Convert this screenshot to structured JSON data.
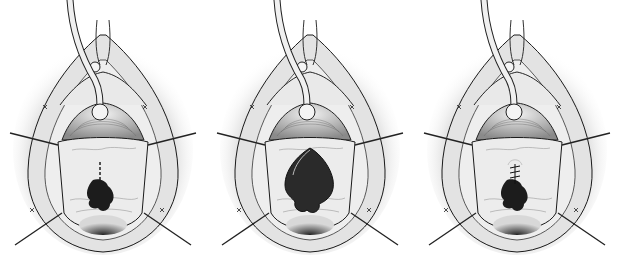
{
  "figure": {
    "panels": [
      {
        "id": "panel-1",
        "left": 0,
        "stage": "incision-marked",
        "defect": "small",
        "incision_line": true,
        "sutures": false
      },
      {
        "id": "panel-2",
        "left": 207,
        "stage": "defect-opened",
        "defect": "large",
        "incision_line": false,
        "sutures": false
      },
      {
        "id": "panel-3",
        "left": 414,
        "stage": "sutured-closure",
        "defect": "small",
        "incision_line": false,
        "sutures": true
      }
    ],
    "colors": {
      "background": "#ffffff",
      "outline": "#1a1a1a",
      "tissue": "#e6e6e6",
      "shadow": "#9a9a9a",
      "defect": "#1c1c1c"
    }
  }
}
